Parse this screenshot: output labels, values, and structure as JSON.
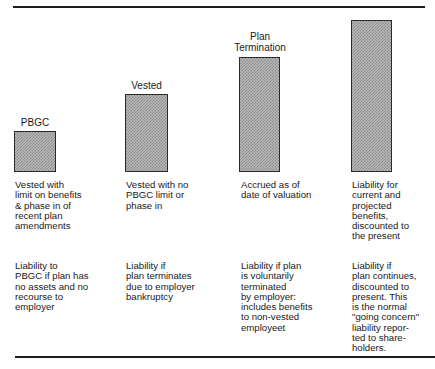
{
  "columns": [
    {
      "bar_label": "PBGC",
      "basis": "Vested with\nlimit on benefits\n& phase in of\nrecent plan\namendments",
      "meaning": "Liability to\nPBGC if plan has\nno assets and no\nrecourse to\nemployer"
    },
    {
      "bar_label": "Vested",
      "basis": "Vested with no\nPBGC limit or\nphase in",
      "meaning": "Liability if\nplan terminates\ndue to employer\nbankruptcy"
    },
    {
      "bar_label": "Plan\nTermination",
      "basis": "Accrued as of\ndate of valuation",
      "meaning": "Liability if plan\nis voluntarily\nterminated\nby employer:\nincludes benefits\nto non-vested\nemployeet"
    },
    {
      "bar_label": "",
      "basis": "Liability for\ncurrent and\nprojected\nbenefits,\ndiscounted to\nthe present",
      "meaning": "Liability if\nplan continues,\ndiscounted to\npresent. This\nis the normal\n\"going concern\"\nliability repor-\nted to share-\nholders."
    }
  ],
  "colors": {
    "rule": "#1c1c1c",
    "bar_fill": "#b8b8b8",
    "bar_border": "#2a2a2a"
  }
}
